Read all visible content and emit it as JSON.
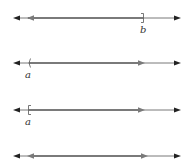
{
  "diagram": {
    "colors": {
      "axis": "#555555",
      "interval": "#7a7a7a",
      "arrow": "#222222"
    },
    "number_lines": [
      {
        "id": "line1",
        "y": 18,
        "interval": "(-infinity, b]",
        "label": "b",
        "endpoint_x": 143,
        "endpoint_type": "closed-bracket-right"
      },
      {
        "id": "line2",
        "y": 63,
        "interval": "(a, infinity)",
        "label": "a",
        "endpoint_x": 29,
        "endpoint_type": "open-paren-left"
      },
      {
        "id": "line3",
        "y": 110,
        "interval": "[a, infinity)",
        "label": "a",
        "endpoint_x": 29,
        "endpoint_type": "closed-bracket-left"
      },
      {
        "id": "line4",
        "y": 156,
        "interval": "(-infinity, infinity)",
        "label": ""
      }
    ]
  }
}
